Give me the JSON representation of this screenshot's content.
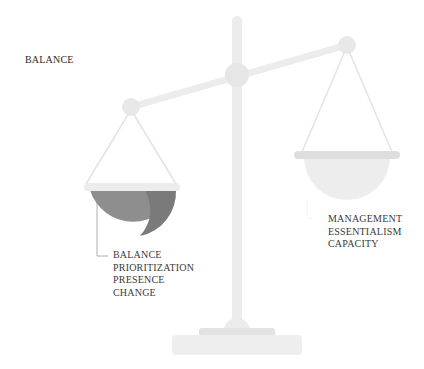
{
  "title": "BALANCE",
  "left_pan": {
    "labels": [
      "BALANCE",
      "PRIORITIZATION",
      "PRESENCE",
      "CHANGE"
    ],
    "color": "#8e8e8e",
    "shade": "#7a7a7a"
  },
  "right_pan": {
    "labels": [
      "MANAGEMENT",
      "ESSENTIALISM",
      "CAPACITY"
    ],
    "color": "#ececec"
  },
  "colors": {
    "frame": "#ececec",
    "rim": "#e3e3e3",
    "text": "#333333"
  }
}
